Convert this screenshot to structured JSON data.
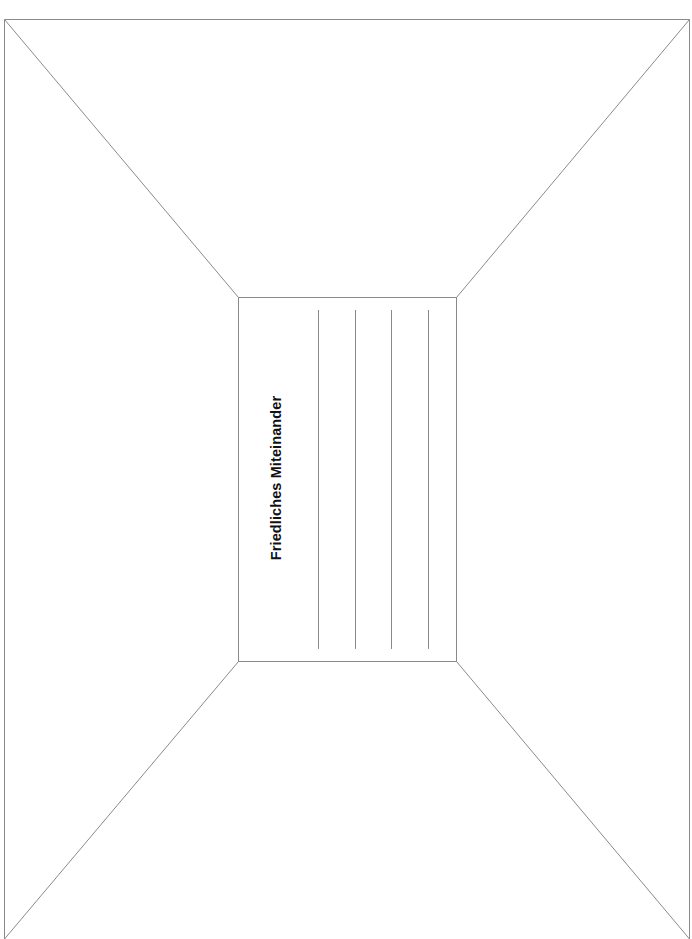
{
  "worksheet": {
    "title": "Friedliches Miteinander",
    "line_color": "#8a8a8a",
    "text_color": "#111111",
    "writing_lines_count": 4
  }
}
